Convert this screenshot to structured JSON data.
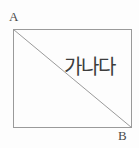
{
  "figure": {
    "type": "geometry-diagram",
    "background_color": "#fdfdfd",
    "stroke_color": "#9a9a9a",
    "text_color": "#3d3d3d",
    "labels": {
      "top_left_vertex": "A",
      "bottom_right_vertex": "B"
    },
    "annotation": {
      "text": "가나다"
    },
    "shape": {
      "rectangle": {
        "x": 13,
        "y": 29,
        "width": 119,
        "height": 99
      },
      "diagonal": {
        "x1": 13,
        "y1": 29,
        "x2": 132,
        "y2": 128
      }
    }
  }
}
